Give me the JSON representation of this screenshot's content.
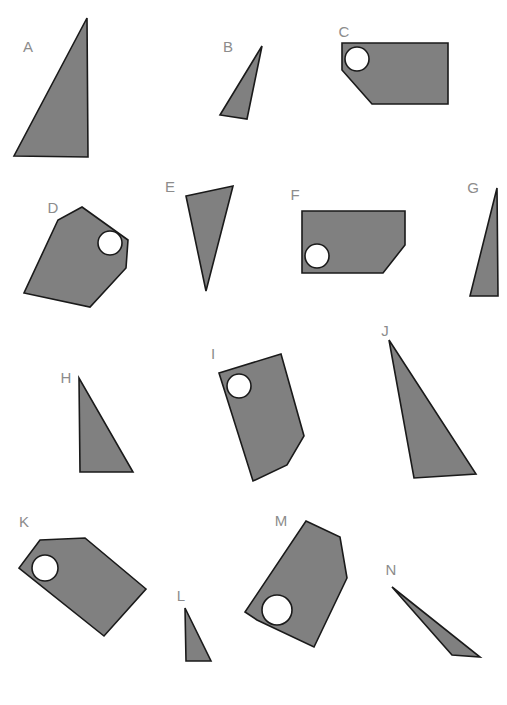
{
  "canvas": {
    "width": 507,
    "height": 705,
    "background": "#ffffff",
    "title": "Geometric shape set"
  },
  "style": {
    "fill_color": "#808080",
    "stroke_color": "#1a1a1a",
    "stroke_width": 1.6,
    "hole_fill": "#ffffff",
    "label_color": "#8c8c8c",
    "label_font_size": 15
  },
  "shapes": [
    {
      "id": "A",
      "label": "A",
      "kind": "triangle",
      "label_x": 28,
      "label_y": 48,
      "points": "87,18 88,157 14,156",
      "hole": null
    },
    {
      "id": "B",
      "label": "B",
      "kind": "triangle",
      "label_x": 228,
      "label_y": 48,
      "points": "262,46 247,119 220,115",
      "hole": null
    },
    {
      "id": "C",
      "label": "C",
      "kind": "hexagon",
      "label_x": 344,
      "label_y": 33,
      "points": "342,43 448,43 448,104 372,104 342,70",
      "hole": {
        "cx": 357,
        "cy": 59,
        "r": 12
      }
    },
    {
      "id": "D",
      "label": "D",
      "kind": "hexagon",
      "label_x": 53,
      "label_y": 209,
      "points": "82,207 128,240 126,268 90,307 24,293 58,220",
      "hole": {
        "cx": 110,
        "cy": 243,
        "r": 12
      }
    },
    {
      "id": "E",
      "label": "E",
      "kind": "triangle",
      "label_x": 170,
      "label_y": 188,
      "points": "186,196 233,186 206,291",
      "hole": null
    },
    {
      "id": "F",
      "label": "F",
      "kind": "hexagon",
      "label_x": 295,
      "label_y": 196,
      "points": "302,211 405,211 405,245 383,273 302,273",
      "hole": {
        "cx": 317,
        "cy": 256,
        "r": 12
      }
    },
    {
      "id": "G",
      "label": "G",
      "kind": "triangle",
      "label_x": 473,
      "label_y": 189,
      "points": "497,188 498,296 470,296",
      "hole": null
    },
    {
      "id": "H",
      "label": "H",
      "kind": "triangle",
      "label_x": 66,
      "label_y": 379,
      "points": "79,378 80,472 133,472",
      "hole": null
    },
    {
      "id": "I",
      "label": "I",
      "kind": "hexagon",
      "label_x": 213,
      "label_y": 355,
      "points": "219,373 281,354 304,436 287,465 253,481",
      "hole": {
        "cx": 239,
        "cy": 386,
        "r": 12
      }
    },
    {
      "id": "J",
      "label": "J",
      "kind": "triangle",
      "label_x": 385,
      "label_y": 332,
      "points": "389,340 476,474 414,478",
      "hole": null
    },
    {
      "id": "K",
      "label": "K",
      "kind": "hexagon",
      "label_x": 24,
      "label_y": 523,
      "points": "40,540 85,538 146,589 104,636 19,568",
      "hole": {
        "cx": 45,
        "cy": 568,
        "r": 13
      }
    },
    {
      "id": "L",
      "label": "L",
      "kind": "triangle",
      "label_x": 181,
      "label_y": 597,
      "points": "185,608 186,661 211,661",
      "hole": null
    },
    {
      "id": "M",
      "label": "M",
      "kind": "hexagon",
      "label_x": 281,
      "label_y": 522,
      "points": "306,521 340,537 347,578 314,647 257,620 245,612",
      "hole": {
        "cx": 277,
        "cy": 610,
        "r": 15
      }
    },
    {
      "id": "N",
      "label": "N",
      "kind": "triangle",
      "label_x": 391,
      "label_y": 571,
      "points": "392,587 480,657 452,655",
      "hole": null
    }
  ]
}
